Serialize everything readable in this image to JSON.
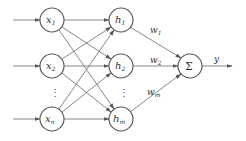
{
  "diagram": {
    "type": "neural-network",
    "colors": {
      "stroke": "#555555",
      "edge": "#6a6a6a",
      "text": "#333333",
      "background": "#ffffff"
    },
    "inputs": [
      {
        "id": "x1",
        "base": "x",
        "sub": "1",
        "cx": 52,
        "cy": 20
      },
      {
        "id": "x2",
        "base": "x",
        "sub": "2",
        "cx": 52,
        "cy": 66
      },
      {
        "id": "xn",
        "base": "x",
        "sub": "n",
        "cx": 52,
        "cy": 119
      }
    ],
    "hidden": [
      {
        "id": "h1",
        "base": "h",
        "sub": "1",
        "cx": 121,
        "cy": 20
      },
      {
        "id": "h2",
        "base": "h",
        "sub": "2",
        "cx": 121,
        "cy": 66
      },
      {
        "id": "hm",
        "base": "h",
        "sub": "m",
        "cx": 121,
        "cy": 119
      }
    ],
    "output_node": {
      "id": "sum",
      "symbol": "Σ",
      "cx": 190,
      "cy": 66
    },
    "weights": [
      {
        "base": "w",
        "sub": "1"
      },
      {
        "base": "w",
        "sub": "2"
      },
      {
        "base": "w",
        "sub": "m"
      }
    ],
    "output_label": "y",
    "ellipsis": "⋮"
  }
}
